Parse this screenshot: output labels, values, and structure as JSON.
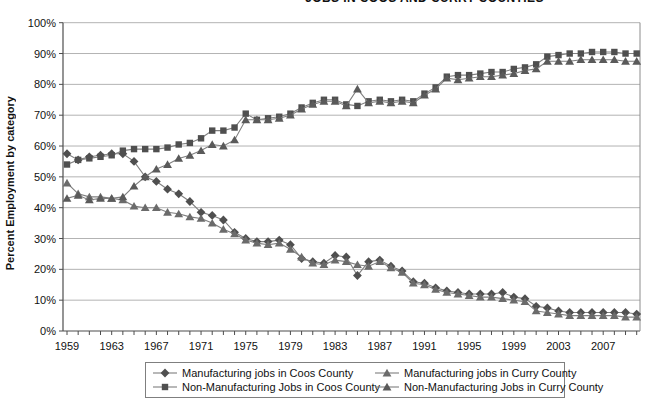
{
  "chart_data": {
    "type": "line",
    "title_visible": "JOBS IN COOS AND CURRY COUNTIES",
    "ylabel": "Percent Employment by category",
    "ylim": [
      0,
      100
    ],
    "y_tick_labels": [
      "0%",
      "10%",
      "20%",
      "30%",
      "40%",
      "50%",
      "60%",
      "70%",
      "80%",
      "90%",
      "100%"
    ],
    "x_ticks": [
      1959,
      1963,
      1967,
      1971,
      1975,
      1979,
      1983,
      1987,
      1991,
      1995,
      1999,
      2003,
      2007
    ],
    "x_range": [
      1959,
      2010
    ],
    "grid": true,
    "legend_position": "bottom",
    "colors": {
      "line": "#7f7f7f",
      "coos_marker": "#4f4f4f",
      "curry_marker": "#6b6b6b",
      "gridline": "#b3b3b3",
      "axis": "#4d4d4d"
    },
    "years": [
      1959,
      1960,
      1961,
      1962,
      1963,
      1964,
      1965,
      1966,
      1967,
      1968,
      1969,
      1970,
      1971,
      1972,
      1973,
      1974,
      1975,
      1976,
      1977,
      1978,
      1979,
      1980,
      1981,
      1982,
      1983,
      1984,
      1985,
      1986,
      1987,
      1988,
      1989,
      1990,
      1991,
      1992,
      1993,
      1994,
      1995,
      1996,
      1997,
      1998,
      1999,
      2000,
      2001,
      2002,
      2003,
      2004,
      2005,
      2006,
      2007,
      2008,
      2009,
      2010
    ],
    "series": [
      {
        "name": "Manufacturing jobs in Coos County",
        "marker": "diamond",
        "color": "#4f4f4f",
        "values": [
          57.5,
          55.5,
          56.5,
          57,
          57.5,
          57.5,
          55,
          50,
          48.5,
          46,
          44.5,
          42,
          38.5,
          37.5,
          36,
          32,
          30,
          29,
          29,
          29.5,
          28,
          23.5,
          22.5,
          22,
          24.5,
          24,
          18,
          22.5,
          23,
          21,
          19.5,
          16,
          15.5,
          14,
          13,
          12.5,
          12,
          12,
          12,
          12.5,
          11,
          10.5,
          8,
          7.5,
          6.5,
          6,
          6,
          6,
          6,
          6,
          6,
          5.5
        ]
      },
      {
        "name": "Non-Manufacturing Jobs in Coos County",
        "marker": "square",
        "color": "#4f4f4f",
        "values": [
          54,
          55.5,
          56,
          56.5,
          57,
          58.5,
          59,
          59,
          59,
          59.5,
          60.5,
          61,
          62.5,
          65,
          65,
          66,
          70.5,
          68.5,
          69,
          69.5,
          70.5,
          72.5,
          74,
          75,
          75,
          73.5,
          73,
          74.5,
          75,
          74.5,
          75,
          74.5,
          77,
          79,
          82.5,
          83,
          83,
          83.5,
          84,
          84,
          85,
          85.5,
          86.5,
          89,
          89.5,
          90,
          90,
          90.5,
          90.5,
          90.5,
          90,
          90
        ]
      },
      {
        "name": "Manufacturing jobs in Curry County",
        "marker": "triangle",
        "color": "#6b6b6b",
        "values": [
          48,
          44.5,
          43.5,
          43.5,
          43,
          42.5,
          40.5,
          40,
          40,
          38.5,
          38,
          37,
          36.5,
          35,
          33,
          31.5,
          29.5,
          28.5,
          28,
          28.5,
          26.5,
          24,
          22,
          21.5,
          23,
          22.5,
          21.5,
          21,
          22.5,
          20.5,
          19,
          15.5,
          15,
          13.5,
          12.5,
          12,
          11.5,
          11,
          11,
          10.5,
          10,
          9.5,
          6.5,
          6,
          5.5,
          5,
          5,
          5,
          5,
          5,
          4.5,
          4.5
        ]
      },
      {
        "name": "Non-Manufacturing Jobs in Curry County",
        "marker": "triangle",
        "color": "#5a5a5a",
        "values": [
          43,
          44,
          42.5,
          43,
          43,
          43.5,
          47,
          50,
          52.5,
          54,
          56,
          57,
          58.5,
          60.5,
          60,
          62,
          68.5,
          68.5,
          68.5,
          69,
          70,
          72,
          73.5,
          74.5,
          74.5,
          73,
          78.5,
          74,
          74.5,
          74,
          74.5,
          74,
          76.5,
          78.5,
          82,
          81.5,
          82,
          82.5,
          82.5,
          83,
          83.5,
          84.5,
          85,
          87.5,
          87.5,
          87.5,
          88,
          88,
          88,
          88,
          87.5,
          87.5
        ]
      }
    ]
  }
}
